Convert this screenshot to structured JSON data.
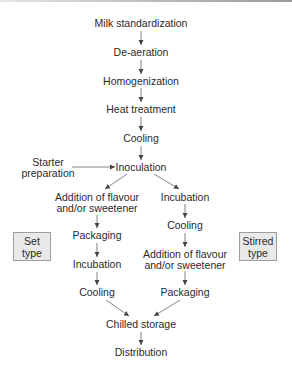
{
  "diagram": {
    "type": "flowchart",
    "main_steps": [
      "Milk standardization",
      "De-aeration",
      "Homogenization",
      "Heat treatment",
      "Cooling",
      "Inoculation"
    ],
    "side_input": {
      "line1": "Starter",
      "line2": "preparation"
    },
    "set_branch": {
      "label_line1": "Set",
      "label_line2": "type",
      "steps": [
        {
          "line1": "Addition of flavour",
          "line2": "and/or sweetener"
        },
        {
          "line1": "Packaging"
        },
        {
          "line1": "Incubation"
        },
        {
          "line1": "Cooling"
        }
      ]
    },
    "stirred_branch": {
      "label_line1": "Stirred",
      "label_line2": "type",
      "steps": [
        {
          "line1": "Incubation"
        },
        {
          "line1": "Cooling"
        },
        {
          "line1": "Addition of flavour",
          "line2": "and/or sweetener"
        },
        {
          "line1": "Packaging"
        }
      ]
    },
    "final_steps": [
      "Chilled storage",
      "Distribution"
    ],
    "colors": {
      "text": "#2a2a2a",
      "arrow": "#555555",
      "box_fill": "#e9e9e9",
      "box_border": "#9d9d9d"
    }
  }
}
